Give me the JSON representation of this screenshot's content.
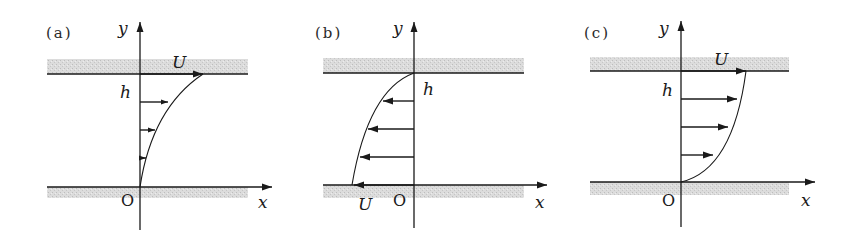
{
  "figure": {
    "colors": {
      "ink": "#1a1a1a",
      "plate_shading": "#d6d6d6"
    },
    "panels": [
      {
        "id": "a",
        "label": "(a)",
        "axis_x": "x",
        "axis_y": "y",
        "origin": "O",
        "height_label": "h",
        "velocity_label": "U",
        "moving_plate": "top",
        "direction": "+x",
        "profile": "concave toward wall, max U at top plate"
      },
      {
        "id": "b",
        "label": "(b)",
        "axis_x": "x",
        "axis_y": "y",
        "origin": "O",
        "height_label": "h",
        "velocity_label": "U",
        "moving_plate": "bottom",
        "direction": "-x",
        "profile": "max U at bottom plate (negative x), zero at top plate"
      },
      {
        "id": "c",
        "label": "(c)",
        "axis_x": "x",
        "axis_y": "y",
        "origin": "O",
        "height_label": "h",
        "velocity_label": "U",
        "moving_plate": "top",
        "direction": "+x",
        "profile": "convex, max U at top plate"
      }
    ]
  }
}
